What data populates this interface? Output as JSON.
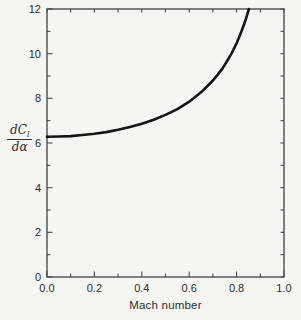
{
  "figure": {
    "xlabel": "Mach number",
    "ylabel": {
      "num_main": "dC",
      "num_sub": "l",
      "den": "dα"
    }
  },
  "chart_data": {
    "type": "line",
    "title": "",
    "xlabel": "Mach number",
    "ylabel": "dCl/da (lift-curve slope, per radian)",
    "xlim": [
      0.0,
      1.0
    ],
    "ylim": [
      0,
      12
    ],
    "grid": false,
    "legend": "none",
    "tick_style": "inward ticks on all four sides of frame",
    "x_tick_labels": [
      "0.0",
      "0.2",
      "0.4",
      "0.6",
      "0.8",
      "1.0"
    ],
    "y_tick_labels": [
      "0",
      "2",
      "4",
      "6",
      "8",
      "10",
      "12"
    ],
    "x_minor_step": 0.1,
    "y_minor_step": 1,
    "series": [
      {
        "name": "dCl/dalpha vs Mach number (compressibility rise from ~2pi)",
        "x": [
          0,
          0.05,
          0.1,
          0.15,
          0.2,
          0.25,
          0.3,
          0.35,
          0.4,
          0.45,
          0.5,
          0.55,
          0.6,
          0.65,
          0.7,
          0.72,
          0.74,
          0.76,
          0.78,
          0.8,
          0.81,
          0.82,
          0.83,
          0.84,
          0.85,
          0.852
        ],
        "y": [
          6.28,
          6.29,
          6.31,
          6.36,
          6.41,
          6.49,
          6.59,
          6.71,
          6.86,
          7.04,
          7.26,
          7.52,
          7.85,
          8.27,
          8.8,
          9.05,
          9.33,
          9.67,
          10.04,
          10.47,
          10.72,
          10.98,
          11.27,
          11.58,
          11.93,
          12.0
        ]
      }
    ],
    "colors": {
      "background": "#f5f5f2",
      "axis": "#4d4d4d",
      "text": "#2e2e2e",
      "curve": "#141414"
    }
  }
}
